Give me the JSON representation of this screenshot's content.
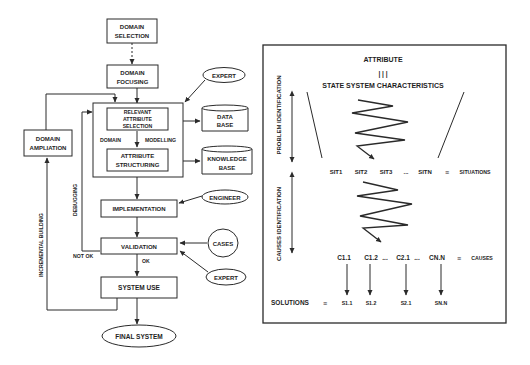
{
  "left_flowchart": {
    "domain_selection": [
      "DOMAIN",
      "SELECTION"
    ],
    "domain_focusing": [
      "DOMAIN",
      "FOCUSING"
    ],
    "expert_top": "EXPERT",
    "relevant_attribute_selection": [
      "RELEVANT",
      "ATTRIBUTE",
      "SELECTION"
    ],
    "domain_label": "DOMAIN",
    "modelling_label": "MODELLING",
    "attribute_structuring": [
      "ATTRIBUTE",
      "STRUCTURING"
    ],
    "data_base": [
      "DATA",
      "BASE"
    ],
    "knowledge_base": [
      "KNOWLEDGE",
      "BASE"
    ],
    "domain_ampliation": [
      "DOMAIN",
      "AMPLIATION"
    ],
    "implementation": "IMPLEMENTATION",
    "engineer": "ENGINEER",
    "validation": "VALIDATION",
    "cases": "CASES",
    "expert_bottom": "EXPERT",
    "ok_label": "OK",
    "not_ok_label": "NOT OK",
    "debugging_label": "DEBUGGING",
    "incremental_building_label": "INCREMENTAL BUILDING",
    "system_use": "SYSTEM USE",
    "final_system": "FINAL SYSTEM"
  },
  "right_panel": {
    "attribute": "ATTRIBUTE",
    "equivalence_bars": "| | |",
    "state_system_characteristics": "STATE SYSTEM CHARACTERISTICS",
    "problem_identification_label": "PROBLEM IDENTIFICATION",
    "causes_identification_label": "CAUSES IDENTIFICATION",
    "situations_row": {
      "items": [
        "SIT1",
        "SIT2",
        "SIT3",
        "...",
        "SITN"
      ],
      "equiv_symbol": "≡",
      "label": "SITUATIONS"
    },
    "causes_row": {
      "items": [
        "C1.1",
        "C1.2",
        "...",
        "C2.1",
        "...",
        "CN.N"
      ],
      "equiv_symbol": "≡",
      "label": "CAUSES"
    },
    "solutions_row": {
      "label": "SOLUTIONS",
      "equiv_symbol": "≡",
      "items": [
        "S1.1",
        "S1.2",
        "S2.1",
        "SN.N"
      ]
    }
  }
}
